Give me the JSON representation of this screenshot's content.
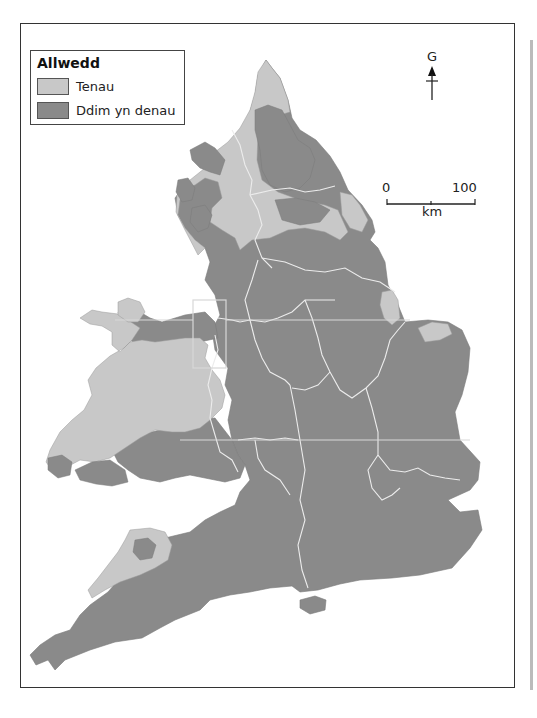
{
  "legend": {
    "title": "Allwedd",
    "items": [
      {
        "label": "Tenau",
        "color": "#c8c8c8"
      },
      {
        "label": "Ddim yn denau",
        "color": "#8a8a8a"
      }
    ]
  },
  "north_arrow": {
    "label": "G"
  },
  "scale_bar": {
    "start": "0",
    "end": "100",
    "unit": "km"
  },
  "colors": {
    "thin": "#c8c8c8",
    "not_thin": "#8a8a8a",
    "boundary": "#e8e8e8",
    "frame": "#333333"
  }
}
